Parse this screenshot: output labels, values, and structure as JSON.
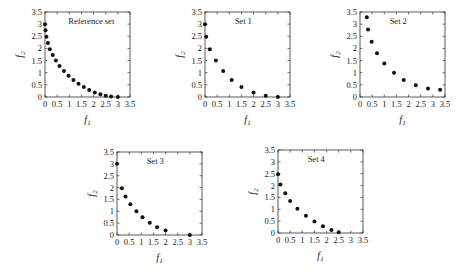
{
  "chart_data": [
    {
      "type": "scatter",
      "title": "Reference set",
      "xlabel": "f1",
      "ylabel": "f2",
      "xlim": [
        0,
        3.5
      ],
      "ylim": [
        0,
        3.5
      ],
      "xticks": [
        "0",
        "0.5",
        "1",
        "1.5",
        "2",
        "2.5",
        "3",
        "3.5"
      ],
      "yticks": [
        "0",
        "0.5",
        "1",
        "1.5",
        "2",
        "2.5",
        "3",
        "3.5"
      ],
      "grid": false,
      "points": [
        [
          0,
          3.0
        ],
        [
          0.02,
          2.75
        ],
        [
          0.06,
          2.48
        ],
        [
          0.12,
          2.22
        ],
        [
          0.2,
          1.97
        ],
        [
          0.32,
          1.73
        ],
        [
          0.45,
          1.5
        ],
        [
          0.6,
          1.28
        ],
        [
          0.78,
          1.07
        ],
        [
          0.97,
          0.88
        ],
        [
          1.17,
          0.7
        ],
        [
          1.38,
          0.55
        ],
        [
          1.6,
          0.41
        ],
        [
          1.82,
          0.29
        ],
        [
          2.05,
          0.19
        ],
        [
          2.28,
          0.11
        ],
        [
          2.5,
          0.05
        ],
        [
          2.72,
          0.02
        ],
        [
          3.0,
          0.0
        ]
      ]
    },
    {
      "type": "scatter",
      "title": "Set 1",
      "xlabel": "f1",
      "ylabel": "f2",
      "xlim": [
        0,
        3.5
      ],
      "ylim": [
        0,
        3.5
      ],
      "xticks": [
        "0",
        "0.5",
        "1",
        "1.5",
        "2",
        "2.5",
        "3",
        "3.5"
      ],
      "yticks": [
        "0",
        "0.5",
        "1",
        "1.5",
        "2",
        "2.5",
        "3",
        "3.5"
      ],
      "grid": false,
      "points": [
        [
          0,
          3.0
        ],
        [
          0.05,
          2.48
        ],
        [
          0.2,
          1.97
        ],
        [
          0.45,
          1.5
        ],
        [
          0.75,
          1.07
        ],
        [
          1.1,
          0.7
        ],
        [
          1.5,
          0.41
        ],
        [
          2.0,
          0.19
        ],
        [
          2.5,
          0.05
        ],
        [
          3.0,
          0.0
        ]
      ]
    },
    {
      "type": "scatter",
      "title": "Set 2",
      "xlabel": "f1",
      "ylabel": "f2",
      "xlim": [
        0,
        3.5
      ],
      "ylim": [
        0,
        3.5
      ],
      "xticks": [
        "0",
        "0.5",
        "1",
        "1.5",
        "2",
        "2.5",
        "3",
        "3.5"
      ],
      "yticks": [
        "0",
        "0.5",
        "1",
        "1.5",
        "2",
        "2.5",
        "3",
        "3.5"
      ],
      "grid": false,
      "points": [
        [
          0.28,
          3.28
        ],
        [
          0.33,
          2.78
        ],
        [
          0.48,
          2.27
        ],
        [
          0.7,
          1.8
        ],
        [
          1.0,
          1.38
        ],
        [
          1.4,
          1.0
        ],
        [
          1.8,
          0.7
        ],
        [
          2.3,
          0.48
        ],
        [
          2.8,
          0.35
        ],
        [
          3.3,
          0.3
        ]
      ]
    },
    {
      "type": "scatter",
      "title": "Set 3",
      "xlabel": "f1",
      "ylabel": "f2",
      "xlim": [
        0,
        3.5
      ],
      "ylim": [
        0,
        3.5
      ],
      "xticks": [
        "0",
        "0.5",
        "1",
        "1.5",
        "2",
        "2.5",
        "3",
        "3.5"
      ],
      "yticks": [
        "0",
        "0.5",
        "1",
        "1.5",
        "2",
        "2.5",
        "3",
        "3.5"
      ],
      "grid": false,
      "points": [
        [
          0,
          3.0
        ],
        [
          0.2,
          1.97
        ],
        [
          0.35,
          1.62
        ],
        [
          0.55,
          1.3
        ],
        [
          0.8,
          1.0
        ],
        [
          1.05,
          0.75
        ],
        [
          1.35,
          0.52
        ],
        [
          1.65,
          0.33
        ],
        [
          2.0,
          0.19
        ],
        [
          3.0,
          0.0
        ]
      ]
    },
    {
      "type": "scatter",
      "title": "Set 4",
      "xlabel": "f1",
      "ylabel": "f2",
      "xlim": [
        0,
        3.5
      ],
      "ylim": [
        0,
        3.5
      ],
      "xticks": [
        "0",
        "0.5",
        "1",
        "1.5",
        "2",
        "2.5",
        "3",
        "3.5"
      ],
      "yticks": [
        "0",
        "0.5",
        "1",
        "1.5",
        "2",
        "2.5",
        "3",
        "3.5"
      ],
      "grid": false,
      "points": [
        [
          0,
          2.48
        ],
        [
          0.1,
          2.05
        ],
        [
          0.3,
          1.68
        ],
        [
          0.5,
          1.35
        ],
        [
          0.8,
          1.02
        ],
        [
          1.15,
          0.73
        ],
        [
          1.5,
          0.48
        ],
        [
          1.85,
          0.28
        ],
        [
          2.2,
          0.13
        ],
        [
          2.5,
          0.03
        ]
      ]
    }
  ],
  "panels": [
    {
      "title": "Reference set",
      "xlabel": "f",
      "xsub": "1",
      "ylabel": "f",
      "ysub": "2"
    },
    {
      "title": "Set 1",
      "xlabel": "f",
      "xsub": "1",
      "ylabel": "f",
      "ysub": "2"
    },
    {
      "title": "Set 2",
      "xlabel": "f",
      "xsub": "1",
      "ylabel": "f",
      "ysub": "2"
    },
    {
      "title": "Set 3",
      "xlabel": "f",
      "xsub": "1",
      "ylabel": "f",
      "ysub": "2"
    },
    {
      "title": "Set 4",
      "xlabel": "f",
      "xsub": "1",
      "ylabel": "f",
      "ysub": "2"
    }
  ]
}
